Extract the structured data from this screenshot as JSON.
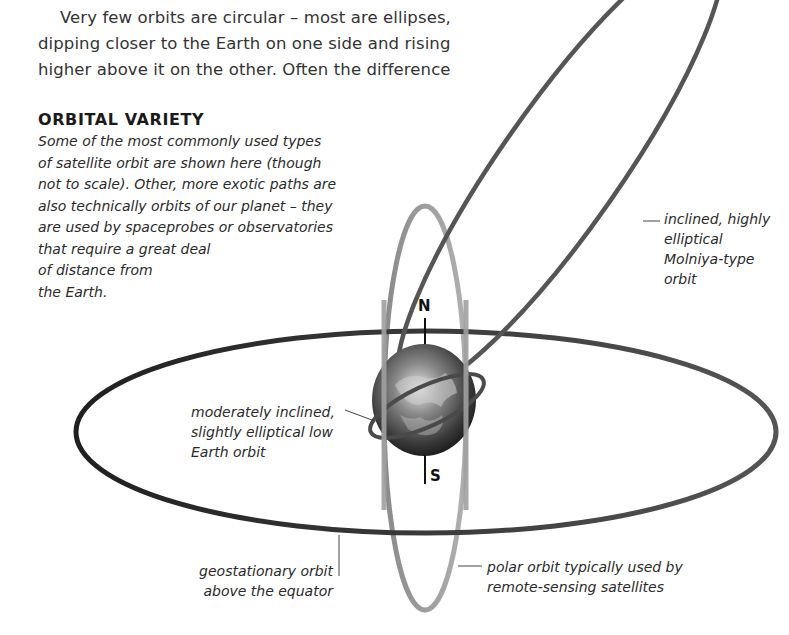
{
  "intro": {
    "lines": [
      "Very few orbits are circular – most are ellipses,",
      "dipping closer to the Earth on one side and rising",
      "higher above it on the other. Often the difference"
    ]
  },
  "sidebar": {
    "title": "ORBITAL VARIETY",
    "caption_lines": [
      "Some of the most commonly used types",
      "of satellite orbit are shown here (though",
      "not to scale). Other, more exotic paths are",
      "also technically orbits of our planet – they",
      "are used by spaceprobes or observatories",
      "that require a great deal",
      "of distance from",
      "the Earth."
    ]
  },
  "diagram": {
    "poles": {
      "north": "N",
      "south": "S"
    },
    "labels": {
      "molniya": [
        "inclined, highly",
        "elliptical",
        "Molniya-type",
        "orbit"
      ],
      "low_earth": [
        "moderately inclined,",
        "slightly elliptical low",
        "Earth orbit"
      ],
      "geostationary": [
        "geostationary orbit",
        "above the equator"
      ],
      "polar": [
        "polar orbit typically used by",
        "remote-sensing satellites"
      ]
    },
    "colors": {
      "orbit_dark": "#2b2b2b",
      "orbit_mid": "#6e6e6e",
      "orbit_light": "#a8a8a8",
      "earth_dark": "#1c1c1c",
      "earth_light": "#d9d9d9"
    }
  }
}
